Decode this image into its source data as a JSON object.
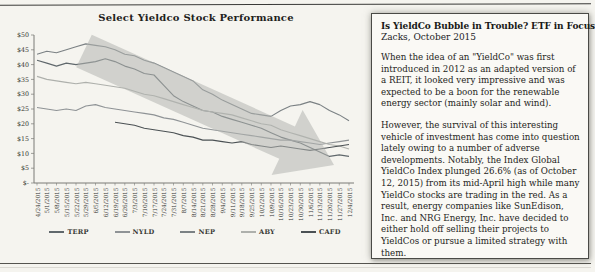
{
  "chart": {
    "title": "Select Yieldco Stock Performance"
  },
  "chart_data": {
    "type": "line",
    "title": "Select Yieldco Stock Performance",
    "x": [
      "4/24/2015",
      "5/1/2015",
      "5/8/2015",
      "5/15/2015",
      "5/22/2015",
      "5/29/2015",
      "6/5/2015",
      "6/12/2015",
      "6/19/2015",
      "6/26/2015",
      "7/3/2015",
      "7/10/2015",
      "7/17/2015",
      "7/24/2015",
      "7/31/2015",
      "8/7/2015",
      "8/14/2015",
      "8/21/2015",
      "8/28/2015",
      "9/4/2015",
      "9/11/2015",
      "9/18/2015",
      "9/25/2015",
      "10/2/2015",
      "10/9/2015",
      "10/16/2015",
      "10/23/2015",
      "10/30/2015",
      "11/6/2015",
      "11/13/2015",
      "11/20/2015",
      "11/27/2015",
      "12/4/2015"
    ],
    "ylim": [
      0,
      50
    ],
    "ytick_step": 5,
    "ylabels": [
      "$-",
      "$5",
      "$10",
      "$15",
      "$20",
      "$25",
      "$30",
      "$35",
      "$40",
      "$45",
      "$50"
    ],
    "grid": false,
    "legend_position": "bottom",
    "series": [
      {
        "name": "TERP",
        "color": "#60686c",
        "values": [
          41.5,
          40.5,
          39.5,
          40.5,
          40,
          40.5,
          41,
          42,
          41,
          39.5,
          38.5,
          37,
          36.5,
          33,
          29.5,
          27.5,
          26,
          24.5,
          24,
          22.5,
          21.5,
          20.5,
          19.5,
          18.5,
          17,
          15.5,
          14.5,
          13.5,
          12,
          10.5,
          9,
          9.5,
          9
        ]
      },
      {
        "name": "NYLD",
        "color": "#8f9396",
        "values": [
          25.5,
          25,
          24.5,
          25,
          24.5,
          26,
          26.5,
          25.5,
          25,
          24.5,
          24,
          23.5,
          23,
          22,
          21.5,
          20.5,
          19.5,
          18.5,
          18,
          17.5,
          17,
          16.5,
          16,
          15.5,
          15,
          14.5,
          14.5,
          14,
          13.5,
          13,
          13.5,
          14,
          14.5
        ]
      },
      {
        "name": "NEP",
        "color": "#7b8184",
        "values": [
          43.5,
          44.5,
          44,
          45,
          46,
          47,
          46.5,
          46,
          45,
          43.5,
          43,
          41.5,
          40.5,
          39,
          37.5,
          36,
          34.5,
          31.5,
          30,
          28,
          26.5,
          25,
          23.5,
          23,
          22.5,
          24.5,
          26,
          26.5,
          27.5,
          26.5,
          24.5,
          23,
          21
        ]
      },
      {
        "name": "ABY",
        "color": "#aeb0ac",
        "values": [
          36,
          35,
          34.5,
          34,
          33.5,
          34,
          33.5,
          33,
          32.5,
          32,
          31,
          30,
          29.5,
          28.5,
          27.5,
          26.5,
          25.5,
          24.5,
          24,
          23.5,
          23,
          22,
          21,
          20,
          19.5,
          18,
          17,
          16,
          15,
          14,
          13,
          12.5,
          11.5
        ]
      },
      {
        "name": "CAFD",
        "color": "#4b5154",
        "values": [
          null,
          null,
          null,
          null,
          null,
          null,
          null,
          null,
          20.5,
          20,
          19.5,
          18.5,
          18,
          17.5,
          17,
          16,
          15.5,
          14.5,
          14.5,
          14,
          13.5,
          14,
          13,
          12.5,
          12,
          12.5,
          12,
          11.5,
          11,
          11.5,
          12,
          12.5,
          13
        ]
      }
    ],
    "annotation": {
      "type": "downward-trend-arrow",
      "color": "#b2b5b0",
      "opacity": 0.55,
      "points": "87.8,9.8 290.9,101.4 298.6,85.1 330,140 267.6,150.1 275.3,133.8 72.2,42.2"
    }
  },
  "article": {
    "title": "Is YieldCo Bubble in Trouble? ETF in Focus",
    "byline": "Zacks, October 2015",
    "paragraphs": [
      "When the idea of an \"YieldCo\" was first introduced in 2012 as an adapted version of a REIT, it looked very impressive and was expected to be a boon for the renewable energy sector (mainly solar and wind).",
      "However, the survival of this interesting vehicle of investment has come into question lately owing to a number of adverse developments. Notably, the Index Global YieldCo Index plunged 26.6% (as of October 12, 2015) from its mid-April high while many YieldCo stocks are trading in the red. As a result, energy companies like SunEdison, Inc. and NRG Energy, Inc. have decided to either hold off selling their projects to YieldCos or pursue a limited strategy with them."
    ]
  }
}
